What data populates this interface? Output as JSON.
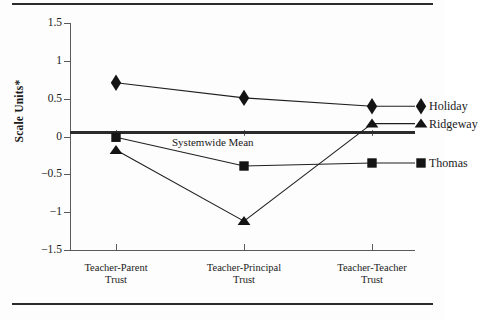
{
  "figure": {
    "top_rule": true,
    "bottom_rule": true,
    "background": "#fdfdfd",
    "foreground": "#1a1a1a",
    "axis_color": "#5a5a5a",
    "zero_line_color": "#2b2b2b"
  },
  "chart_data": {
    "type": "line",
    "title": "",
    "subtitle": "",
    "xlabel": "",
    "ylabel": "Scale Units*",
    "ylim": [
      -1.5,
      1.5
    ],
    "yticks": [
      1.5,
      1,
      0.5,
      0,
      -0.5,
      -1,
      -1.5
    ],
    "ytick_labels": [
      "1.5",
      "1",
      "0.5",
      "0",
      "−0.5",
      "−1",
      "−1.5"
    ],
    "grid": false,
    "legend_position": "right-inline",
    "categories": [
      "Teacher-Parent Trust",
      "Teacher-Principal Trust",
      "Teacher-Teacher Trust"
    ],
    "category_lines": [
      [
        "Teacher-Parent",
        "Trust"
      ],
      [
        "Teacher-Principal",
        "Trust"
      ],
      [
        "Teacher-Teacher",
        "Trust"
      ]
    ],
    "series": [
      {
        "name": "Holiday",
        "marker": "diamond",
        "values": [
          0.71,
          0.51,
          0.4
        ]
      },
      {
        "name": "Ridgeway",
        "marker": "triangle",
        "values": [
          -0.18,
          -1.12,
          0.17
        ]
      },
      {
        "name": "Thomas",
        "marker": "square",
        "values": [
          -0.01,
          -0.39,
          -0.35
        ]
      }
    ],
    "annotations": [
      {
        "text": "Systemwide Mean",
        "y": 0,
        "note": "bold horizontal reference line at zero"
      }
    ]
  },
  "legend": {
    "items": [
      {
        "label": "Holiday",
        "marker": "diamond"
      },
      {
        "label": "Ridgeway",
        "marker": "triangle"
      },
      {
        "label": "Thomas",
        "marker": "square"
      }
    ]
  }
}
